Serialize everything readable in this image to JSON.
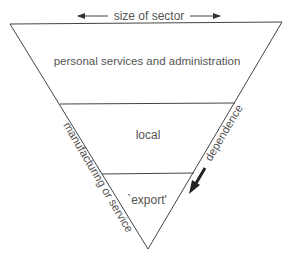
{
  "diagram": {
    "top_label": "size of sector",
    "tiers": [
      {
        "label": "personal  services and administration"
      },
      {
        "label": "local"
      },
      {
        "label": "`export'"
      }
    ],
    "left_side_label": "manufacturing  or service",
    "right_side_label": "dependence",
    "colors": {
      "line": "#444444",
      "text": "#555555",
      "arrow": "#222222"
    }
  }
}
